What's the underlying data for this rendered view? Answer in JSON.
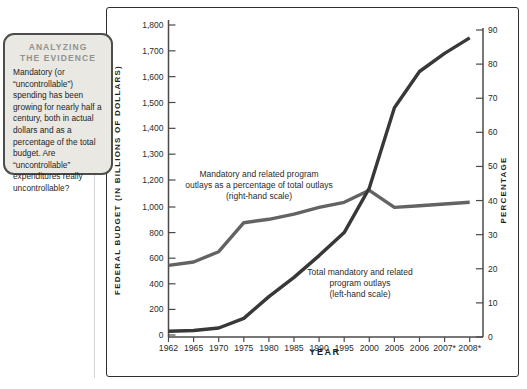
{
  "sidebar": {
    "title_line1": "ANALYZING",
    "title_line2": "THE EVIDENCE",
    "body": "Mandatory (or “uncontrollable”) spending has been growing for nearly half a century, both in actual dollars and as a percentage of the total budget. Are “uncontrollable” expenditures really uncontrollable?"
  },
  "chart_data": {
    "type": "line",
    "x_categories": [
      "1962",
      "1965",
      "1970",
      "1975",
      "1980",
      "1985",
      "1990",
      "1995",
      "2000",
      "2005",
      "2006",
      "2007*",
      "2008*"
    ],
    "x_axis_label": "YEAR",
    "series": [
      {
        "name": "Total mandatory and related program outlays (left-hand scale)",
        "axis": "left",
        "color": "#383838",
        "values": [
          30,
          35,
          55,
          130,
          300,
          450,
          620,
          800,
          1140,
          1480,
          1620,
          1690,
          1750
        ]
      },
      {
        "name": "Mandatory and related program outlays as a percentage of total outlays (right-hand scale)",
        "axis": "right",
        "color": "#636363",
        "values": [
          21,
          22,
          25,
          33.5,
          34.5,
          36,
          38,
          39.5,
          43,
          38,
          38.5,
          39,
          39.5
        ]
      }
    ],
    "left_axis": {
      "label": "FEDERAL BUDGET (IN BILLIONS OF DOLLARS)",
      "tick_labels": [
        "1,800",
        "1,700",
        "1,600",
        "1,500",
        "1,400",
        "1,300",
        "1,200",
        "1,000",
        "800",
        "600",
        "400",
        "200",
        "0"
      ],
      "tick_values": [
        1800,
        1700,
        1600,
        1500,
        1400,
        1300,
        1200,
        1000,
        800,
        600,
        400,
        200,
        0
      ],
      "scale_note": "non-uniform scale: 100-unit label steps above 1,200; 200-unit label steps below",
      "ylim": [
        0,
        1800
      ]
    },
    "right_axis": {
      "label": "PERCENTAGE",
      "tick_labels": [
        "90",
        "80",
        "70",
        "60",
        "50",
        "40",
        "30",
        "20",
        "10",
        "0"
      ],
      "tick_values": [
        90,
        80,
        70,
        60,
        50,
        40,
        30,
        20,
        10,
        0
      ],
      "ylim": [
        0,
        90
      ]
    },
    "annotations": {
      "pct_line": "Mandatory and related program\noutlays as a percentage of total outlays\n(right-hand scale)",
      "dollar_line": "Total mandatory and related\nprogram outlays\n(left-hand scale)"
    },
    "legend": "none",
    "grid": false
  }
}
